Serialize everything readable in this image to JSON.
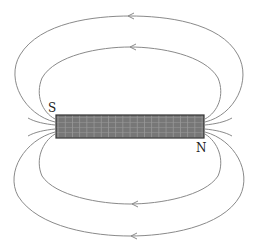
{
  "diagram": {
    "title": "",
    "poles": {
      "left": "S",
      "right": "N"
    },
    "field_lines": [
      {
        "id": "outer-top",
        "arrow_direction": "left"
      },
      {
        "id": "inner-top",
        "arrow_direction": "left"
      },
      {
        "id": "inner-bottom",
        "arrow_direction": "left"
      },
      {
        "id": "outer-bottom",
        "arrow_direction": "left"
      }
    ],
    "colors": {
      "field_line": "#8a8a8a",
      "solenoid_fill": "#777777",
      "solenoid_grid": "#bbbbbb",
      "solenoid_border": "#333333",
      "label": "#222222"
    }
  }
}
